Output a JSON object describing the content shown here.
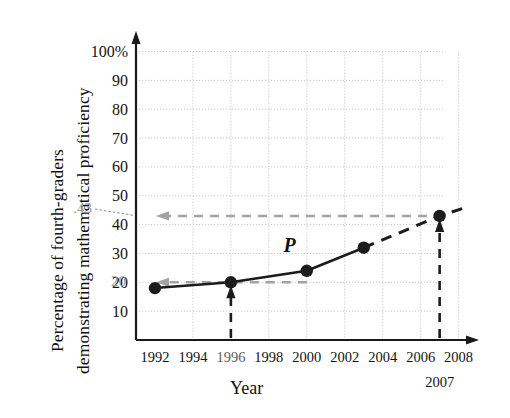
{
  "chart_data": {
    "type": "line",
    "title": "",
    "xlabel": "Year",
    "ylabel_line1": "Percentage of fourth-graders",
    "ylabel_line2": "demonstrating mathematical proficiency",
    "xlim": [
      1991,
      2008.6
    ],
    "ylim": [
      0,
      104
    ],
    "grid": true,
    "legend": "none",
    "x_ticks": [
      "1992",
      "1994",
      "1996",
      "1998",
      "2000",
      "2002",
      "2004",
      "2006",
      "2008"
    ],
    "x_tick_values": [
      1992,
      1994,
      1996,
      1998,
      2000,
      2002,
      2004,
      2006,
      2008
    ],
    "y_ticks": [
      "100%",
      "90",
      "80",
      "70",
      "60",
      "50",
      "40",
      "30",
      "20",
      "10"
    ],
    "y_tick_values": [
      100,
      90,
      80,
      70,
      60,
      50,
      40,
      30,
      20,
      10
    ],
    "series": [
      {
        "name": "P",
        "style": "solid",
        "x": [
          1992,
          1996,
          2000,
          2003
        ],
        "values": [
          18,
          20,
          24,
          32
        ]
      },
      {
        "name": "P extrapolated",
        "style": "dashed",
        "x": [
          2003,
          2007,
          2008.4
        ],
        "values": [
          32,
          43,
          46
        ]
      }
    ],
    "points": [
      {
        "x": 1992,
        "y": 18
      },
      {
        "x": 1996,
        "y": 20
      },
      {
        "x": 2000,
        "y": 24
      },
      {
        "x": 2003,
        "y": 32
      },
      {
        "x": 2007,
        "y": 43
      }
    ],
    "curve_label": "P",
    "annotations": [
      {
        "name": "value-43",
        "text": ".43",
        "y": 43,
        "kind": "y-readoff"
      },
      {
        "name": "value-20",
        "text": "20",
        "y": 20,
        "kind": "y-readoff"
      },
      {
        "name": "year-2007",
        "text": "2007",
        "x": 2007,
        "kind": "x-callout"
      }
    ],
    "guides": [
      {
        "name": "guide-1996-vertical",
        "x": 1996,
        "to_y": 20,
        "style": "dashed"
      },
      {
        "name": "guide-1996-horizontal",
        "y": 20,
        "to_x": 1992,
        "style": "dashed"
      },
      {
        "name": "guide-2007-vertical",
        "x": 2007,
        "to_y": 43,
        "style": "dashed"
      },
      {
        "name": "guide-2007-horizontal",
        "y": 43,
        "to_x": 1992,
        "style": "dashed"
      }
    ]
  },
  "colors": {
    "axis": "#1a1a1a",
    "curve": "#1c1c1c",
    "grid": "#c9c9c9",
    "guide_gray": "#a3a3a3",
    "guide_dark": "#1c1c1c",
    "annotation_gray": "#9a9a9a",
    "background": "#ffffff"
  }
}
